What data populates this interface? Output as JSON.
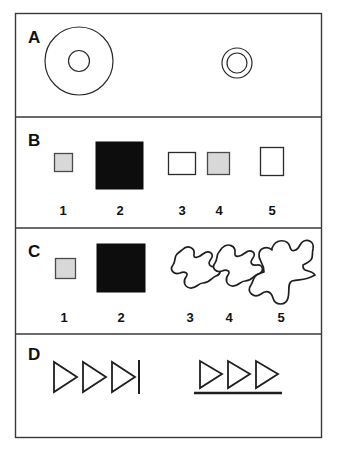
{
  "figure": {
    "background_color": "#ffffff",
    "frame_color": "#3a3a3a",
    "ink_color": "#1f1f1f",
    "gray_fill": "#d8d8d8",
    "black_fill": "#0d0d0d",
    "panels": [
      {
        "letter": "A",
        "description": "Two concentric-circle figures: one large, one small",
        "items": [
          {
            "name": "large-concentric-circles",
            "outer_radius": 34,
            "inner_radius": 10
          },
          {
            "name": "small-concentric-circles",
            "outer_radius": 15,
            "inner_radius": 10
          }
        ]
      },
      {
        "letter": "B",
        "description": "Row of five squares and rectangles with numeric labels",
        "numbers": [
          "1",
          "2",
          "3",
          "4",
          "5"
        ],
        "items": [
          {
            "name": "small-gray-square",
            "number": "1",
            "fill": "gray",
            "size": "small"
          },
          {
            "name": "large-black-square",
            "number": "2",
            "fill": "black",
            "size": "large"
          },
          {
            "name": "white-wide-rectangle",
            "number": "3",
            "fill": "white",
            "size": "medium-wide"
          },
          {
            "name": "gray-square",
            "number": "4",
            "fill": "gray",
            "size": "medium"
          },
          {
            "name": "white-tall-rectangle",
            "number": "5",
            "fill": "white",
            "size": "medium-tall"
          }
        ]
      },
      {
        "letter": "C",
        "description": "Gray square, black square, and three amoeba-like blobs of increasing size",
        "numbers": [
          "1",
          "2",
          "3",
          "4",
          "5"
        ],
        "items": [
          {
            "name": "small-gray-square",
            "number": "1",
            "fill": "gray",
            "size": "small"
          },
          {
            "name": "large-black-square",
            "number": "2",
            "fill": "black",
            "size": "large"
          },
          {
            "name": "small-blob",
            "number": "3",
            "fill": "white",
            "size": "small"
          },
          {
            "name": "medium-blob",
            "number": "4",
            "fill": "white",
            "size": "small"
          },
          {
            "name": "large-blob",
            "number": "5",
            "fill": "white",
            "size": "large"
          }
        ]
      },
      {
        "letter": "D",
        "description": "Left: three outlined triangles followed by a vertical bar. Right: three outlined triangles above a horizontal underline",
        "groups": [
          {
            "name": "triangles-with-vertical-bar",
            "triangle_count": 3,
            "marker": "vertical-bar"
          },
          {
            "name": "triangles-with-underline",
            "triangle_count": 3,
            "marker": "horizontal-underline"
          }
        ]
      }
    ]
  }
}
